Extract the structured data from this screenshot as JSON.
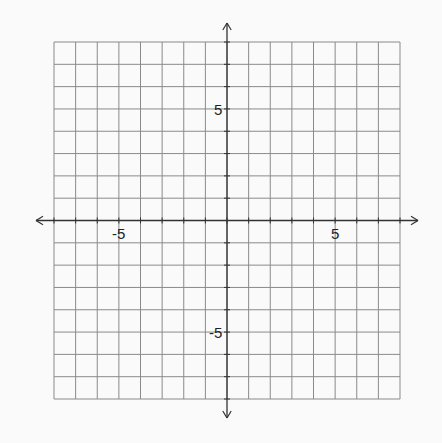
{
  "grid": {
    "x_min": -8,
    "x_max": 8,
    "y_min": -8,
    "y_max": 8,
    "left": 54,
    "right": 400,
    "top": 42,
    "bottom": 399,
    "line_color": "#8a8a8a",
    "axis_color": "#333333",
    "background": "#fafafa"
  },
  "labels": {
    "x_neg": "-5",
    "x_pos": "5",
    "y_pos": "5",
    "y_neg": "-5"
  }
}
